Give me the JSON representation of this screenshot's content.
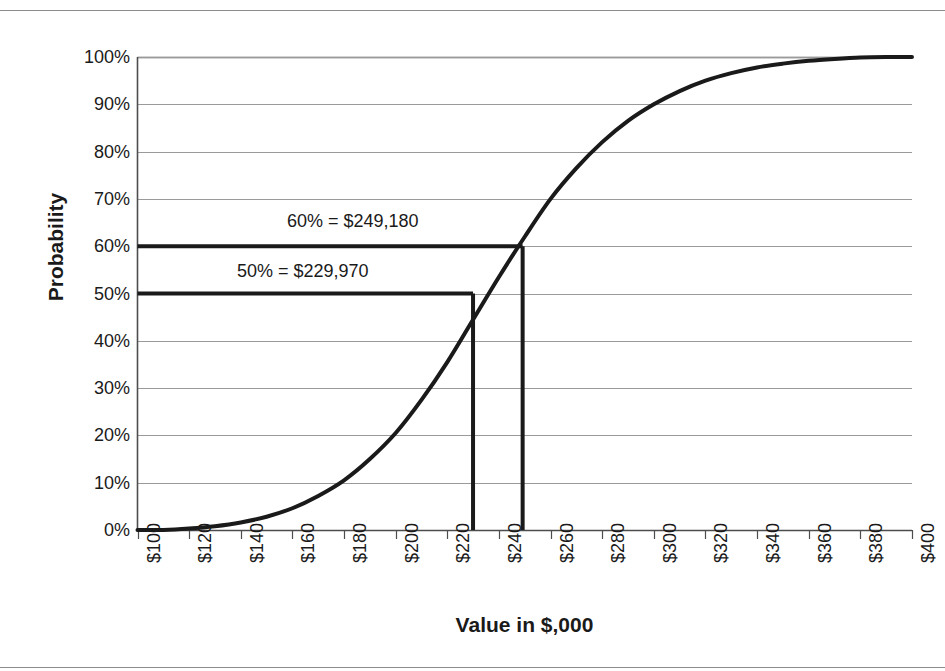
{
  "figure": {
    "has_top_rule": true,
    "has_bottom_rule": true,
    "background": "#ffffff"
  },
  "chart_data": {
    "type": "line",
    "title": "",
    "subtitle": "",
    "xlabel": "Value in $,000",
    "ylabel": "Probability",
    "xlim": [
      100,
      400
    ],
    "ylim": [
      0,
      100
    ],
    "grid": true,
    "grid_axis": "y",
    "legend": false,
    "legend_position": "none",
    "x_tick_labels": [
      "$100",
      "$120",
      "$140",
      "$160",
      "$180",
      "$200",
      "$220",
      "$240",
      "$260",
      "$280",
      "$300",
      "$320",
      "$340",
      "$360",
      "$380",
      "$400"
    ],
    "x_ticks": [
      100,
      120,
      140,
      160,
      180,
      200,
      220,
      240,
      260,
      280,
      300,
      320,
      340,
      360,
      380,
      400
    ],
    "y_tick_labels": [
      "0%",
      "10%",
      "20%",
      "30%",
      "40%",
      "50%",
      "60%",
      "70%",
      "80%",
      "90%",
      "100%"
    ],
    "y_ticks": [
      0,
      10,
      20,
      30,
      40,
      50,
      60,
      70,
      80,
      90,
      100
    ],
    "series": [
      {
        "name": "Cumulative probability",
        "color": "#1a1a1a",
        "line_width": 4,
        "x": [
          100,
          110,
          120,
          130,
          140,
          150,
          160,
          170,
          180,
          190,
          200,
          210,
          220,
          230,
          240,
          250,
          260,
          270,
          280,
          290,
          300,
          310,
          320,
          330,
          340,
          350,
          360,
          370,
          380,
          390,
          400
        ],
        "values": [
          0,
          0,
          0.3,
          0.8,
          1.6,
          2.8,
          4.6,
          7.2,
          10.5,
          15.0,
          20.5,
          27.5,
          35.5,
          44.5,
          53.5,
          62.0,
          70.0,
          76.5,
          82.0,
          86.5,
          90.0,
          92.8,
          95.0,
          96.6,
          97.8,
          98.6,
          99.2,
          99.6,
          99.9,
          100,
          100
        ]
      }
    ],
    "annotations": [
      {
        "id": "p60",
        "text": "60% = $249,180",
        "probability": 60,
        "value": 249180,
        "value_k": 249.18,
        "guide_color": "#1a1a1a"
      },
      {
        "id": "p50",
        "text": "50% = $229,970",
        "probability": 50,
        "value": 229970,
        "value_k": 229.97,
        "guide_color": "#1a1a1a"
      }
    ],
    "colors": {
      "curve": "#1a1a1a",
      "grid": "#9a9a9a",
      "axis": "#4d4d4d",
      "guide": "#1a1a1a",
      "text": "#1a1a1a"
    }
  }
}
